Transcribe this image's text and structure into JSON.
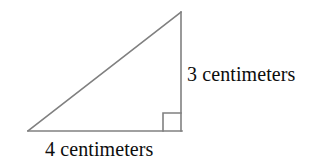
{
  "figure": {
    "kind": "right-triangle-diagram",
    "background_color": "#ffffff",
    "stroke_color": "#808080",
    "text_color": "#0d0d0d",
    "canvas": {
      "width": 317,
      "height": 163
    },
    "geometry": {
      "left_vertex": {
        "x": 28,
        "y": 131
      },
      "right_angle_vertex": {
        "x": 181,
        "y": 131
      },
      "apex_vertex": {
        "x": 181,
        "y": 12
      },
      "right_angle_marker": {
        "x": 163,
        "y": 113,
        "size": 18
      }
    },
    "labels": {
      "vertical_leg": "3 centimeters",
      "base": "4 centimeters"
    },
    "measures": {
      "vertical_leg_value": 3,
      "vertical_leg_unit": "centimeters",
      "base_value": 4,
      "base_unit": "centimeters"
    }
  }
}
